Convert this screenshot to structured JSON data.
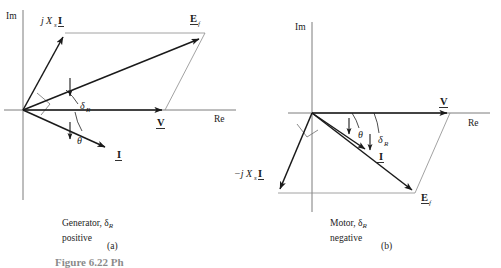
{
  "figure": {
    "type": "phasor-diagram-pair",
    "background": "#ffffff",
    "ink": "#1a1a1a",
    "partial_caption": "Figure 6.22  Ph"
  },
  "panels": [
    {
      "id": "a",
      "title_line1": "Generator, δ",
      "title_sub1": "R",
      "title_line2": "positive",
      "label": "(a)",
      "axes": {
        "imaginary": "Im",
        "real": "Re"
      },
      "origin": {
        "x": 23,
        "y": 110
      },
      "vectors": [
        {
          "name": "reactance-drop",
          "label_prefix": "j",
          "label_sym": "X",
          "label_sub": "s",
          "label_bold": "I",
          "tip": {
            "x": 65,
            "y": 33
          },
          "label_pos": {
            "x": 41,
            "y": 22
          }
        },
        {
          "name": "excitation-voltage",
          "label_bold": "E",
          "label_sub": "f",
          "tip": {
            "x": 202,
            "y": 36
          },
          "label_pos": {
            "x": 191,
            "y": 20
          }
        },
        {
          "name": "terminal-voltage",
          "label_bold": "V",
          "tip": {
            "x": 165,
            "y": 110
          },
          "label_pos": {
            "x": 158,
            "y": 124
          }
        },
        {
          "name": "armature-current",
          "label_bold": "I",
          "tip": {
            "x": 108,
            "y": 150
          },
          "label_pos": {
            "x": 118,
            "y": 155
          }
        }
      ],
      "angles": [
        {
          "name": "power-angle",
          "symbol": "δ",
          "sub": "R",
          "label_pos": {
            "x": 78,
            "y": 106
          }
        },
        {
          "name": "power-factor-angle",
          "symbol": "θ",
          "sub": "",
          "label_pos": {
            "x": 75,
            "y": 139
          }
        }
      ]
    },
    {
      "id": "b",
      "title_line1": "Motor, δ",
      "title_sub1": "R",
      "title_line2": "negative",
      "label": "(b)",
      "axes": {
        "imaginary": "Im",
        "real": "Re"
      },
      "origin": {
        "x": 312,
        "y": 113
      },
      "vectors": [
        {
          "name": "reactance-drop",
          "label_prefix": "−j",
          "label_sym": "X",
          "label_sub": "s",
          "label_bold": "I",
          "tip": {
            "x": 278,
            "y": 193
          },
          "label_pos": {
            "x": 236,
            "y": 173
          }
        },
        {
          "name": "excitation-voltage",
          "label_bold": "E",
          "label_sub": "f",
          "tip": {
            "x": 415,
            "y": 193
          },
          "label_pos": {
            "x": 422,
            "y": 199
          }
        },
        {
          "name": "terminal-voltage",
          "label_bold": "V",
          "tip": {
            "x": 450,
            "y": 113
          },
          "label_pos": {
            "x": 441,
            "y": 104
          }
        },
        {
          "name": "armature-current",
          "label_bold": "I",
          "tip": {
            "x": 368,
            "y": 152
          },
          "label_pos": {
            "x": 379,
            "y": 157
          }
        }
      ],
      "angles": [
        {
          "name": "power-factor-angle",
          "symbol": "θ",
          "sub": "",
          "label_pos": {
            "x": 361,
            "y": 133
          }
        },
        {
          "name": "power-angle",
          "symbol": "δ",
          "sub": "R",
          "label_pos": {
            "x": 380,
            "y": 138
          }
        }
      ]
    }
  ]
}
